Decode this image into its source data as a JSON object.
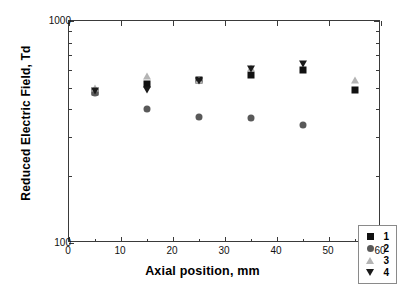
{
  "chart_data": {
    "type": "scatter",
    "title": "",
    "xlabel": "Axial position, mm",
    "ylabel": "Reduced Electric Field, Td",
    "xlim": [
      0,
      60
    ],
    "ylim": [
      100,
      1000
    ],
    "yscale": "log",
    "xscale": "linear",
    "xticks": [
      0,
      10,
      20,
      30,
      40,
      50,
      60
    ],
    "yticks": [
      100,
      1000
    ],
    "grid": false,
    "legend_position": "lower right",
    "x": [
      5,
      15,
      25,
      35,
      45,
      55
    ],
    "series": [
      {
        "name": "1",
        "marker": "square",
        "color": "#111111",
        "values": [
          480,
          520,
          540,
          570,
          600,
          490
        ]
      },
      {
        "name": "2",
        "marker": "circle",
        "color": "#595959",
        "values": [
          475,
          400,
          370,
          365,
          340,
          null
        ]
      },
      {
        "name": "3",
        "marker": "triangle-up",
        "color": "#b4b4b4",
        "values": [
          500,
          565,
          545,
          615,
          null,
          540
        ]
      },
      {
        "name": "4",
        "marker": "triangle-down",
        "color": "#1a1a1a",
        "values": [
          483,
          488,
          535,
          605,
          640,
          null
        ]
      }
    ]
  },
  "axes": {
    "x_tick_labels": [
      "0",
      "10",
      "20",
      "30",
      "40",
      "50",
      "60"
    ],
    "y_tick_labels": [
      "1000",
      "100"
    ],
    "x_axis_title": "Axial position, mm",
    "y_axis_title": "Reduced Electric Field, Td"
  },
  "legend": {
    "items": [
      {
        "label": "1",
        "marker": "square-icon"
      },
      {
        "label": "2",
        "marker": "circle-icon"
      },
      {
        "label": "3",
        "marker": "triangle-up-icon"
      },
      {
        "label": "4",
        "marker": "triangle-down-icon"
      }
    ]
  },
  "colors": {
    "series_1": "#111111",
    "series_2": "#595959",
    "series_3": "#b4b4b4",
    "series_4": "#1a1a1a",
    "axis": "#3a3a3a",
    "background": "#ffffff"
  }
}
